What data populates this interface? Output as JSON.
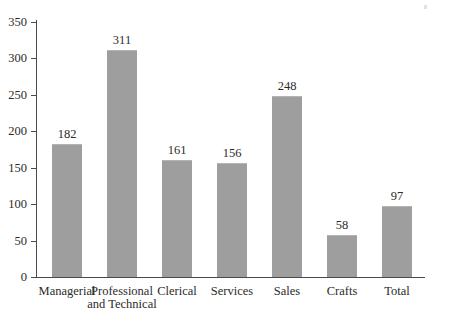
{
  "chart_data": {
    "type": "bar",
    "title": "",
    "subtitle": "",
    "xlabel": "",
    "ylabel": "",
    "categories": [
      "Managerial",
      "Professional and Technical",
      "Clerical",
      "Services",
      "Sales",
      "Crafts",
      "Total"
    ],
    "category_lines": [
      [
        "Managerial"
      ],
      [
        "Professional",
        "and Technical"
      ],
      [
        "Clerical"
      ],
      [
        "Services"
      ],
      [
        "Sales"
      ],
      [
        "Crafts"
      ],
      [
        "Total"
      ]
    ],
    "values": [
      182,
      311,
      161,
      156,
      248,
      58,
      97
    ],
    "data_labels": [
      "182",
      "311",
      "161",
      "156",
      "248",
      "58",
      "97"
    ],
    "ylim": [
      0,
      350
    ],
    "y_ticks": [
      0,
      50,
      100,
      150,
      200,
      250,
      300,
      350
    ],
    "y_tick_labels": [
      "0",
      "50",
      "100",
      "150",
      "200",
      "250",
      "300",
      "350"
    ],
    "grid": false,
    "legend": false,
    "legend_position": "none",
    "bar_color": "#9e9e9e",
    "axis_color": "#4a4a4a",
    "text_color": "#2b2b2b",
    "background_color": "#ffffff"
  }
}
